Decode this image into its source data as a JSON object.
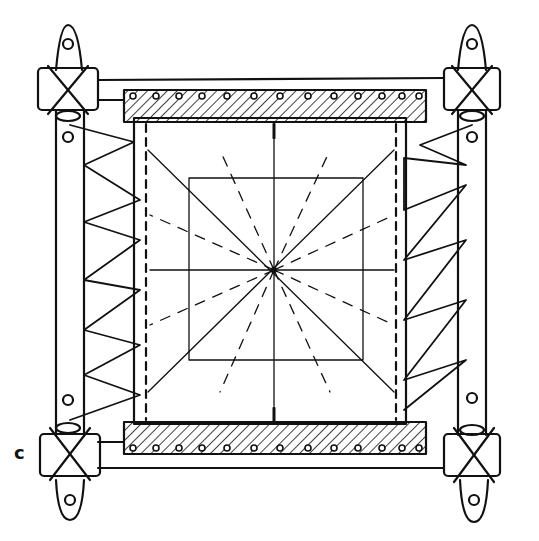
{
  "figure": {
    "label": "c",
    "colors": {
      "ink": "#111111",
      "paper": "#ffffff"
    }
  }
}
